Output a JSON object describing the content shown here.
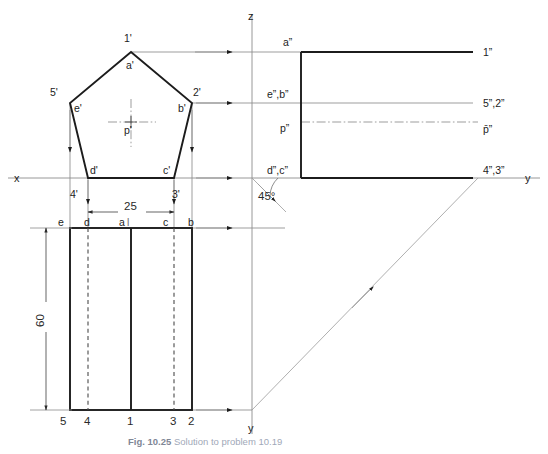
{
  "figure": {
    "type": "orthographic-projection-drawing",
    "caption_prefix": "Fig. 10.25",
    "caption_rest": "Solution to problem 10.19"
  },
  "axes": {
    "x_label": "x",
    "z_label": "z",
    "y_label_right": "y",
    "y_label_bottom": "y",
    "origin_x": 252,
    "origin_y": 178
  },
  "front_view": {
    "name": "pentagon-front-view",
    "vertices": [
      {
        "id": "a-prime",
        "label": "a'",
        "x": 131,
        "y": 52,
        "label_dx": -4,
        "label_dy": 17
      },
      {
        "id": "b-prime",
        "label": "b'",
        "x": 192,
        "y": 103,
        "label_dx": -15,
        "label_dy": 9
      },
      {
        "id": "c-prime",
        "label": "c'",
        "x": 174,
        "y": 178,
        "label_dx": -11,
        "label_dy": -4
      },
      {
        "id": "d-prime",
        "label": "d'",
        "x": 88,
        "y": 178,
        "label_dx": 2,
        "label_dy": -4
      },
      {
        "id": "e-prime",
        "label": "e'",
        "x": 70,
        "y": 103,
        "label_dx": 4,
        "label_dy": 9
      }
    ],
    "corner_numbers": [
      {
        "id": "n1-prime",
        "label": "1'",
        "x": 128,
        "y": 38
      },
      {
        "id": "n2-prime",
        "label": "2'",
        "x": 196,
        "y": 92
      },
      {
        "id": "n3-prime",
        "label": "3'",
        "x": 175,
        "y": 194
      },
      {
        "id": "n4-prime",
        "label": "4'",
        "x": 74,
        "y": 194
      },
      {
        "id": "n5-prime",
        "label": "5'",
        "x": 52,
        "y": 92
      }
    ],
    "centre": {
      "id": "p-prime",
      "label": "p'",
      "x": 131,
      "y": 130,
      "mark_x": 131,
      "mark_y": 122
    }
  },
  "top_view": {
    "name": "rectangle-top-view",
    "left": 70,
    "right": 192,
    "top": 228,
    "bottom": 410,
    "vertical_lines": [
      {
        "id": "line-5-e",
        "x": 70,
        "style": "object",
        "top_label": "e",
        "bottom_label": "5"
      },
      {
        "id": "line-4-d",
        "x": 88,
        "style": "hidden",
        "top_label": "d",
        "bottom_label": "4"
      },
      {
        "id": "line-1-a",
        "x": 131,
        "style": "object",
        "top_label": "a",
        "bottom_label": "1"
      },
      {
        "id": "line-3-c",
        "x": 174,
        "style": "hidden",
        "top_label": "c",
        "bottom_label": "3"
      },
      {
        "id": "line-2-b",
        "x": 192,
        "style": "object",
        "top_label": "b",
        "bottom_label": "2"
      }
    ],
    "extra_label": {
      "id": "a-tick",
      "label": "l",
      "x": 139,
      "y": 226
    }
  },
  "side_view": {
    "name": "profile-side-view",
    "left": 301,
    "right": 473,
    "top": 52,
    "bottom": 178,
    "labels_left": [
      {
        "id": "a-dd",
        "label": "a”",
        "x": 288,
        "y": 44
      },
      {
        "id": "eb-dd",
        "label": "e”,b”",
        "x": 271,
        "y": 96
      },
      {
        "id": "p-dd",
        "label": "p”",
        "x": 284,
        "y": 130
      },
      {
        "id": "dc-dd",
        "label": "d”,c”",
        "x": 271,
        "y": 172
      }
    ],
    "labels_right": [
      {
        "id": "n1-dd",
        "label": "1”",
        "x": 482,
        "y": 55
      },
      {
        "id": "n52-dd",
        "label": "5”,2”",
        "x": 482,
        "y": 106
      },
      {
        "id": "p-dd-r",
        "label": "p̄”",
        "x": 482,
        "y": 133
      },
      {
        "id": "n43-dd",
        "label": "4”,3”",
        "x": 482,
        "y": 175
      }
    ],
    "horizontal_levels": {
      "top_z": 52,
      "mid_z": 103,
      "centre_z": 122,
      "base_z": 178
    }
  },
  "mitre": {
    "name": "45-degree-mitre-line",
    "angle_label": "45°",
    "angle_label_x": 263,
    "angle_label_y": 196,
    "start_x": 252,
    "start_y": 178,
    "end_x": 252,
    "end_y": 410,
    "corner_x": 478
  },
  "dimensions": [
    {
      "id": "dim-width-25",
      "value": "25",
      "orientation": "horizontal",
      "x1": 88,
      "x2": 174,
      "y": 212,
      "label_x": 131,
      "label_y": 207
    },
    {
      "id": "dim-height-60",
      "value": "60",
      "orientation": "vertical",
      "x": 46,
      "y1": 228,
      "y2": 410,
      "label_x": 40,
      "label_y": 319
    }
  ],
  "colors": {
    "object_line": "#1c1c1c",
    "projection_line": "#8c8c8c",
    "hidden_line": "#4a4a4a",
    "background": "#ffffff",
    "caption_text": "#9fa8b8"
  }
}
